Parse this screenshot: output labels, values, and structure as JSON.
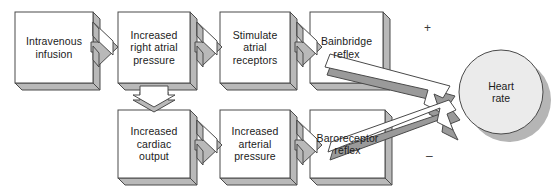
{
  "diagram": {
    "colors": {
      "box_face": "#ffffff",
      "box_edge": "#4a4a4a",
      "shade_top": "#b9b9b9",
      "shade_dark": "#9a9a9a",
      "circle_fill": "#ebebeb",
      "circle_shadow": "#b5b5b5",
      "text": "#1b1b1b",
      "background": "#ffffff"
    },
    "top_row": [
      {
        "id": "intravenous-infusion",
        "label": "Intravenous\ninfusion"
      },
      {
        "id": "increased-right-atrial-pressure",
        "label": "Increased\nright atrial\npressure"
      },
      {
        "id": "stimulate-atrial-receptors",
        "label": "Stimulate\natrial\nreceptors"
      },
      {
        "id": "bainbridge-reflex",
        "label": "Bainbridge\nreflex"
      }
    ],
    "bottom_row": [
      {
        "id": "increased-cardiac-output",
        "label": "Increased\ncardiac\noutput"
      },
      {
        "id": "increased-arterial-pressure",
        "label": "Increased\narterial\npressure"
      },
      {
        "id": "baroreceptor-reflex",
        "label": "Baroreceptor\nreflex"
      }
    ],
    "outcome": {
      "id": "heart-rate",
      "label": "Heart\nrate"
    },
    "signs": {
      "positive": "+",
      "negative": "–"
    }
  }
}
